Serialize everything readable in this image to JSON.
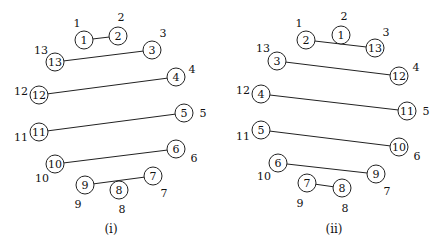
{
  "diagrams": [
    {
      "caption": "(i)",
      "positions": [
        {
          "pos": "1",
          "node": "1",
          "cx": 84,
          "cy": 40,
          "lx": 77,
          "ly": 23
        },
        {
          "pos": "2",
          "node": "2",
          "cx": 118,
          "cy": 36,
          "lx": 121,
          "ly": 17
        },
        {
          "pos": "3",
          "node": "3",
          "cx": 152,
          "cy": 50,
          "lx": 163,
          "ly": 33
        },
        {
          "pos": "4",
          "node": "4",
          "cx": 176,
          "cy": 77,
          "lx": 192,
          "ly": 69
        },
        {
          "pos": "5",
          "node": "5",
          "cx": 184,
          "cy": 113,
          "lx": 203,
          "ly": 113
        },
        {
          "pos": "6",
          "node": "6",
          "cx": 176,
          "cy": 149,
          "lx": 194,
          "ly": 158
        },
        {
          "pos": "7",
          "node": "7",
          "cx": 153,
          "cy": 176,
          "lx": 164,
          "ly": 193
        },
        {
          "pos": "8",
          "node": "8",
          "cx": 119,
          "cy": 190,
          "lx": 122,
          "ly": 209
        },
        {
          "pos": "9",
          "node": "9",
          "cx": 85,
          "cy": 185,
          "lx": 78,
          "ly": 204
        },
        {
          "pos": "10",
          "node": "10",
          "cx": 55,
          "cy": 164,
          "lx": 42,
          "ly": 178
        },
        {
          "pos": "11",
          "node": "11",
          "cx": 39,
          "cy": 132,
          "lx": 21,
          "ly": 137
        },
        {
          "pos": "12",
          "node": "12",
          "cx": 39,
          "cy": 95,
          "lx": 21,
          "ly": 91
        },
        {
          "pos": "13",
          "node": "13",
          "cx": 55,
          "cy": 62,
          "lx": 41,
          "ly": 50
        }
      ],
      "edges": [
        [
          "1",
          "2"
        ],
        [
          "13",
          "3"
        ],
        [
          "12",
          "4"
        ],
        [
          "11",
          "5"
        ],
        [
          "10",
          "6"
        ],
        [
          "9",
          "7"
        ]
      ]
    },
    {
      "caption": "(ii)",
      "positions": [
        {
          "pos": "1",
          "node": "2",
          "cx": 306,
          "cy": 40,
          "lx": 299,
          "ly": 23
        },
        {
          "pos": "2",
          "node": "1",
          "cx": 341,
          "cy": 35,
          "lx": 344,
          "ly": 16
        },
        {
          "pos": "3",
          "node": "13",
          "cx": 375,
          "cy": 48,
          "lx": 386,
          "ly": 32
        },
        {
          "pos": "4",
          "node": "12",
          "cx": 399,
          "cy": 76,
          "lx": 416,
          "ly": 67
        },
        {
          "pos": "5",
          "node": "11",
          "cx": 407,
          "cy": 111,
          "lx": 426,
          "ly": 111
        },
        {
          "pos": "6",
          "node": "10",
          "cx": 399,
          "cy": 147,
          "lx": 417,
          "ly": 156
        },
        {
          "pos": "7",
          "node": "9",
          "cx": 376,
          "cy": 174,
          "lx": 387,
          "ly": 191
        },
        {
          "pos": "8",
          "node": "8",
          "cx": 342,
          "cy": 188,
          "lx": 345,
          "ly": 208
        },
        {
          "pos": "9",
          "node": "7",
          "cx": 307,
          "cy": 183,
          "lx": 300,
          "ly": 203
        },
        {
          "pos": "10",
          "node": "6",
          "cx": 278,
          "cy": 163,
          "lx": 264,
          "ly": 176
        },
        {
          "pos": "11",
          "node": "5",
          "cx": 261,
          "cy": 130,
          "lx": 243,
          "ly": 136
        },
        {
          "pos": "12",
          "node": "4",
          "cx": 261,
          "cy": 94,
          "lx": 243,
          "ly": 90
        },
        {
          "pos": "13",
          "node": "3",
          "cx": 277,
          "cy": 61,
          "lx": 263,
          "ly": 48
        }
      ],
      "edges": [
        [
          "2",
          "13"
        ],
        [
          "3",
          "12"
        ],
        [
          "4",
          "11"
        ],
        [
          "5",
          "10"
        ],
        [
          "6",
          "9"
        ],
        [
          "7",
          "8"
        ]
      ]
    }
  ],
  "caption_positions": [
    {
      "x": 111,
      "y": 229
    },
    {
      "x": 334,
      "y": 229
    }
  ],
  "node_radius": 9
}
